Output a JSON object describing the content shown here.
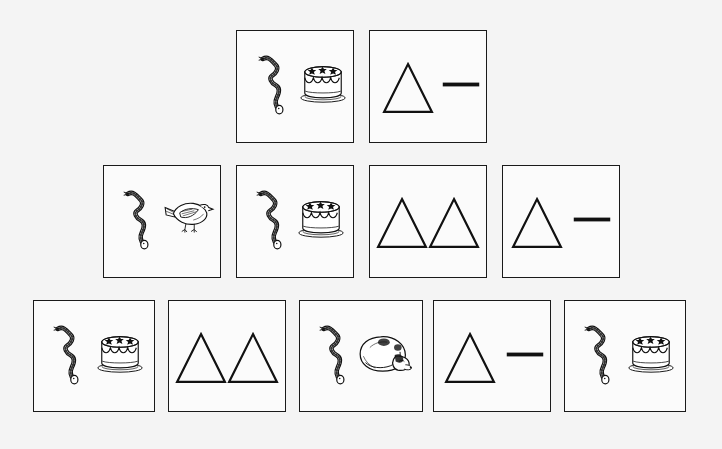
{
  "page": {
    "background_color": "#f4f4f4",
    "card_fill_color": "#fbfbfb",
    "card_border_color": "#1a1a1a",
    "ink_color": "#111111",
    "layout": "pyramid",
    "row_count": 3,
    "total_cards": 11
  },
  "rows": [
    {
      "row_label": "row-1",
      "card_count": 2,
      "cards": [
        {
          "card_label": "row1-card1",
          "x": 236,
          "y": 30,
          "w": 118,
          "h": 113,
          "content_type": "pictures",
          "items": [
            {
              "icon": "snake-icon",
              "name": "snake",
              "x": 10,
              "y": 22,
              "w": 48,
              "h": 62
            },
            {
              "icon": "cake-icon",
              "name": "cake",
              "x": 62,
              "y": 30,
              "w": 48,
              "h": 44
            }
          ]
        },
        {
          "card_label": "row1-card2",
          "x": 369,
          "y": 30,
          "w": 118,
          "h": 113,
          "content_type": "symbols",
          "items": [
            {
              "icon": "triangle-icon",
              "name": "triangle",
              "x": 12,
              "y": 22,
              "w": 52,
              "h": 70
            },
            {
              "icon": "dash-icon",
              "name": "dash",
              "x": 72,
              "y": 50,
              "w": 38,
              "h": 7
            }
          ]
        }
      ]
    },
    {
      "row_label": "row-2",
      "card_count": 4,
      "cards": [
        {
          "card_label": "row2-card1",
          "x": 103,
          "y": 165,
          "w": 118,
          "h": 113,
          "content_type": "pictures",
          "items": [
            {
              "icon": "snake-icon",
              "name": "snake",
              "x": 8,
              "y": 22,
              "w": 48,
              "h": 62
            },
            {
              "icon": "bird-icon",
              "name": "bird",
              "x": 58,
              "y": 28,
              "w": 52,
              "h": 48
            }
          ]
        },
        {
          "card_label": "row2-card2",
          "x": 236,
          "y": 165,
          "w": 118,
          "h": 113,
          "content_type": "pictures",
          "items": [
            {
              "icon": "snake-icon",
              "name": "snake",
              "x": 8,
              "y": 22,
              "w": 48,
              "h": 62
            },
            {
              "icon": "cake-icon",
              "name": "cake",
              "x": 60,
              "y": 30,
              "w": 48,
              "h": 44
            }
          ]
        },
        {
          "card_label": "row2-card3",
          "x": 369,
          "y": 165,
          "w": 118,
          "h": 113,
          "content_type": "symbols",
          "items": [
            {
              "icon": "triangle-icon",
              "name": "triangle",
              "x": 6,
              "y": 22,
              "w": 52,
              "h": 70
            },
            {
              "icon": "triangle-icon",
              "name": "triangle",
              "x": 58,
              "y": 22,
              "w": 52,
              "h": 70
            }
          ]
        },
        {
          "card_label": "row2-card4",
          "x": 502,
          "y": 165,
          "w": 118,
          "h": 113,
          "content_type": "symbols",
          "items": [
            {
              "icon": "triangle-icon",
              "name": "triangle",
              "x": 8,
              "y": 22,
              "w": 52,
              "h": 70
            },
            {
              "icon": "dash-icon",
              "name": "dash",
              "x": 70,
              "y": 50,
              "w": 38,
              "h": 7
            }
          ]
        }
      ]
    },
    {
      "row_label": "row-3",
      "card_count": 5,
      "cards": [
        {
          "card_label": "row3-card1",
          "x": 33,
          "y": 300,
          "w": 122,
          "h": 112,
          "content_type": "pictures",
          "items": [
            {
              "icon": "snake-icon",
              "name": "snake",
              "x": 8,
              "y": 22,
              "w": 48,
              "h": 62
            },
            {
              "icon": "cake-icon",
              "name": "cake",
              "x": 62,
              "y": 30,
              "w": 48,
              "h": 44
            }
          ]
        },
        {
          "card_label": "row3-card2",
          "x": 168,
          "y": 300,
          "w": 118,
          "h": 112,
          "content_type": "symbols",
          "items": [
            {
              "icon": "triangle-icon",
              "name": "triangle",
              "x": 6,
              "y": 22,
              "w": 52,
              "h": 70
            },
            {
              "icon": "triangle-icon",
              "name": "triangle",
              "x": 58,
              "y": 22,
              "w": 52,
              "h": 70
            }
          ]
        },
        {
          "card_label": "row3-card3",
          "x": 299,
          "y": 300,
          "w": 124,
          "h": 112,
          "content_type": "pictures",
          "items": [
            {
              "icon": "snake-icon",
              "name": "snake",
              "x": 8,
              "y": 22,
              "w": 48,
              "h": 62
            },
            {
              "icon": "sleeping-dog-icon",
              "name": "sleeping dog",
              "x": 58,
              "y": 32,
              "w": 56,
              "h": 42
            }
          ]
        },
        {
          "card_label": "row3-card4",
          "x": 433,
          "y": 300,
          "w": 118,
          "h": 112,
          "content_type": "symbols",
          "items": [
            {
              "icon": "triangle-icon",
              "name": "triangle",
              "x": 10,
              "y": 22,
              "w": 52,
              "h": 70
            },
            {
              "icon": "dash-icon",
              "name": "dash",
              "x": 72,
              "y": 50,
              "w": 38,
              "h": 7
            }
          ]
        },
        {
          "card_label": "row3-card5",
          "x": 564,
          "y": 300,
          "w": 122,
          "h": 112,
          "content_type": "pictures",
          "items": [
            {
              "icon": "snake-icon",
              "name": "snake",
              "x": 8,
              "y": 22,
              "w": 48,
              "h": 62
            },
            {
              "icon": "cake-icon",
              "name": "cake",
              "x": 62,
              "y": 30,
              "w": 48,
              "h": 44
            }
          ]
        }
      ]
    }
  ]
}
